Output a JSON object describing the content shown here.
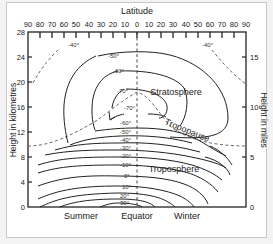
{
  "diagram": {
    "title": "Latitude",
    "top_axis": {
      "label": "Latitude",
      "ticks": [
        "90",
        "80",
        "70",
        "60",
        "50",
        "40",
        "30",
        "20",
        "10",
        "0",
        "10",
        "20",
        "30",
        "40",
        "50",
        "60",
        "70",
        "80",
        "90"
      ]
    },
    "left_axis": {
      "label": "Height in kilometres",
      "ticks": [
        "0",
        "4",
        "8",
        "12",
        "16",
        "20",
        "24",
        "28"
      ]
    },
    "right_axis": {
      "label": "Height in miles",
      "ticks": [
        "0",
        "5",
        "10",
        "15"
      ]
    },
    "bottom_labels": {
      "summer": "Summer",
      "equator": "Equator",
      "winter": "Winter"
    },
    "regions": {
      "stratosphere": "Stratosphere",
      "tropopause": "Tropopause",
      "troposphere": "Troposphere"
    },
    "isotherm_labels": {
      "left_top_minus40": "-40°",
      "right_top_minus40": "-40°",
      "minus50": "-50°",
      "minus60_upper": "-60°",
      "minus70_upper": "-70°",
      "minus70_lower": "-70°",
      "minus60_lower": "-60°",
      "minus50_lower": "-50°",
      "minus40": "-40°",
      "minus30": "-30°",
      "minus20": "-20°",
      "minus10": "-10°",
      "zero": "0°",
      "plus10": "10°",
      "plus20": "20°",
      "plus30": "30°"
    },
    "colors": {
      "line": "#222222",
      "dashed": "#555555",
      "background": "#ffffff"
    }
  }
}
